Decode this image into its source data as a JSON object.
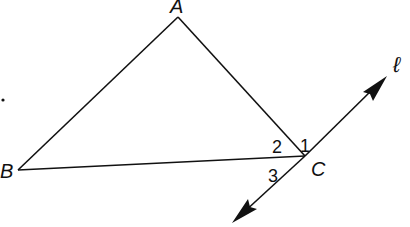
{
  "diagram": {
    "type": "geometry",
    "stroke_color": "#111111",
    "background": "#ffffff",
    "points": {
      "A": {
        "label": "A",
        "x": 178,
        "y": 17
      },
      "B": {
        "label": "B",
        "x": 18,
        "y": 170
      },
      "C": {
        "label": "C",
        "x": 305,
        "y": 156
      }
    },
    "segments": [
      {
        "from": "A",
        "to": "B"
      },
      {
        "from": "A",
        "to": "C"
      },
      {
        "from": "B",
        "to": "C"
      }
    ],
    "line": {
      "label": "ℓ",
      "through": "C",
      "end1": {
        "x": 385,
        "y": 78
      },
      "end2": {
        "x": 233,
        "y": 222
      },
      "arrows": "both"
    },
    "angle_labels": [
      {
        "label": "1",
        "x": 306,
        "y": 148
      },
      {
        "label": "2",
        "x": 273,
        "y": 151
      },
      {
        "label": "3",
        "x": 273,
        "y": 181
      }
    ],
    "labels": {
      "A": "A",
      "B": "B",
      "C": "C",
      "line": "ℓ",
      "angle1": "1",
      "angle2": "2",
      "angle3": "3"
    }
  }
}
